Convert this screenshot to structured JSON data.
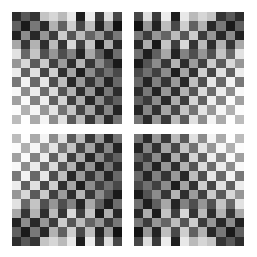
{
  "figure": {
    "title": "",
    "background_color": "#ffffff",
    "canvas": {
      "width": 257,
      "height": 257
    }
  },
  "chart_data": {
    "type": "heatmap",
    "title": "",
    "subtitle": "",
    "xlabel": "",
    "ylabel": "",
    "grid": false,
    "legend": null,
    "colormap": "grayscale",
    "value_range": [
      0,
      255
    ],
    "tile_grid": {
      "rows": 2,
      "cols": 2
    },
    "cells_per_tile": {
      "rows": 12,
      "cols": 12
    },
    "tiles": [
      {
        "name": "top-left",
        "transform": "none",
        "x": 12,
        "y": 12,
        "width": 110,
        "height": 112
      },
      {
        "name": "top-right",
        "transform": "mirror-horizontal",
        "x": 134,
        "y": 12,
        "width": 110,
        "height": 112
      },
      {
        "name": "bottom-left",
        "transform": "mirror-vertical",
        "x": 12,
        "y": 134,
        "width": 110,
        "height": 112
      },
      {
        "name": "bottom-right",
        "transform": "mirror-both",
        "x": 134,
        "y": 134,
        "width": 110,
        "height": 112
      }
    ],
    "base_tile_values": [
      [
        45,
        88,
        52,
        196,
        214,
        186,
        232,
        30,
        236,
        58,
        222,
        70
      ],
      [
        96,
        26,
        120,
        40,
        178,
        96,
        206,
        72,
        190,
        34,
        152,
        18
      ],
      [
        34,
        140,
        40,
        150,
        60,
        204,
        86,
        188,
        100,
        150,
        60,
        120
      ],
      [
        168,
        54,
        178,
        46,
        186,
        52,
        216,
        62,
        196,
        26,
        174,
        40
      ],
      [
        226,
        104,
        196,
        80,
        150,
        78,
        130,
        36,
        168,
        96,
        30,
        110
      ],
      [
        150,
        216,
        90,
        202,
        64,
        156,
        46,
        180,
        54,
        140,
        84,
        26
      ],
      [
        236,
        96,
        224,
        70,
        206,
        48,
        164,
        30,
        140,
        64,
        112,
        72
      ],
      [
        120,
        242,
        104,
        230,
        78,
        190,
        40,
        154,
        52,
        128,
        36,
        104
      ],
      [
        248,
        140,
        236,
        108,
        218,
        84,
        178,
        46,
        150,
        34,
        120,
        44
      ],
      [
        160,
        250,
        130,
        238,
        96,
        212,
        62,
        172,
        40,
        140,
        58,
        96
      ],
      [
        252,
        176,
        246,
        150,
        228,
        114,
        196,
        70,
        164,
        48,
        134,
        36
      ],
      [
        188,
        254,
        170,
        244,
        140,
        224,
        90,
        186,
        56,
        152,
        42,
        116
      ]
    ],
    "gradient_note": "Luminance of the light-phase squares increases toward the lower-left corner; dark-phase squares deepen toward the upper-right, producing a diagonal shading band."
  }
}
